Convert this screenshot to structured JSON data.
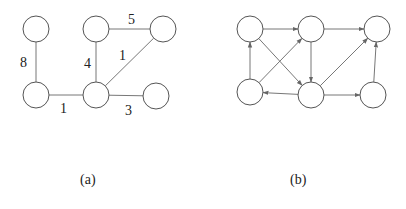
{
  "figure": {
    "graph_a": {
      "caption": "(a)",
      "type": "undirected-weighted",
      "nodes": [
        {
          "id": "A",
          "x": 36,
          "y": 29
        },
        {
          "id": "B",
          "x": 96,
          "y": 29
        },
        {
          "id": "C",
          "x": 163,
          "y": 29
        },
        {
          "id": "D",
          "x": 36,
          "y": 95
        },
        {
          "id": "E",
          "x": 96,
          "y": 95
        },
        {
          "id": "F",
          "x": 156,
          "y": 96
        }
      ],
      "edges": [
        {
          "from": "A",
          "to": "D",
          "weight": "8",
          "lx": 20,
          "ly": 67
        },
        {
          "from": "D",
          "to": "E",
          "weight": "1",
          "lx": 60,
          "ly": 113
        },
        {
          "from": "E",
          "to": "B",
          "weight": "4",
          "lx": 84,
          "ly": 68
        },
        {
          "from": "B",
          "to": "C",
          "weight": "5",
          "lx": 128,
          "ly": 24
        },
        {
          "from": "E",
          "to": "C",
          "weight": "1",
          "lx": 119,
          "ly": 60
        },
        {
          "from": "E",
          "to": "F",
          "weight": "3",
          "lx": 125,
          "ly": 115
        }
      ]
    },
    "graph_b": {
      "caption": "(b)",
      "type": "directed",
      "nodes": [
        {
          "id": "P",
          "x": 250,
          "y": 29
        },
        {
          "id": "Q",
          "x": 311,
          "y": 29
        },
        {
          "id": "R",
          "x": 377,
          "y": 29
        },
        {
          "id": "S",
          "x": 250,
          "y": 92
        },
        {
          "id": "T",
          "x": 311,
          "y": 95
        },
        {
          "id": "U",
          "x": 373,
          "y": 95
        }
      ],
      "edges": [
        {
          "from": "P",
          "to": "Q"
        },
        {
          "from": "Q",
          "to": "R"
        },
        {
          "from": "S",
          "to": "P"
        },
        {
          "from": "S",
          "to": "Q"
        },
        {
          "from": "P",
          "to": "T"
        },
        {
          "from": "Q",
          "to": "T"
        },
        {
          "from": "T",
          "to": "S"
        },
        {
          "from": "T",
          "to": "R"
        },
        {
          "from": "T",
          "to": "U"
        },
        {
          "from": "U",
          "to": "R"
        }
      ]
    }
  }
}
